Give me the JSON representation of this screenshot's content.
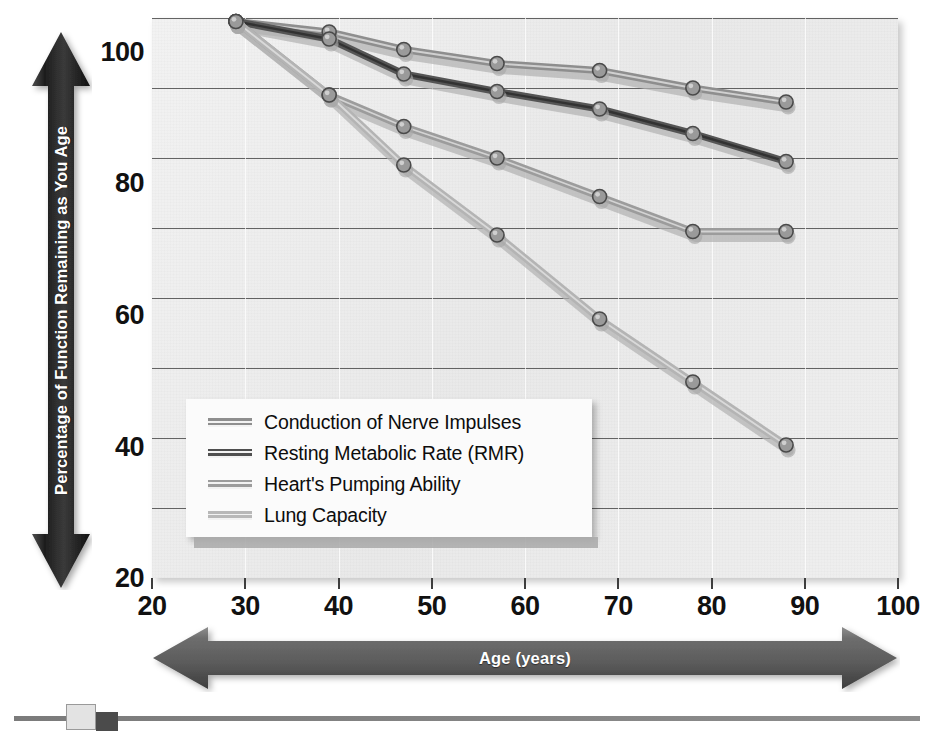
{
  "chart_data": {
    "type": "line",
    "title": "",
    "subtitle": "",
    "xlabel": "Age (years)",
    "ylabel": "Percentage of Function Remaining as You Age",
    "xlim": [
      20,
      100
    ],
    "ylim": [
      20,
      100
    ],
    "x_ticks": [
      20,
      30,
      40,
      50,
      60,
      70,
      80,
      90,
      100
    ],
    "y_ticks": [
      20,
      40,
      60,
      80,
      100
    ],
    "y_gridlines": [
      20,
      30,
      40,
      50,
      60,
      70,
      80,
      90,
      100
    ],
    "grid": true,
    "legend_position": "lower-left",
    "x": [
      29,
      39,
      47,
      57,
      68,
      78,
      88
    ],
    "series": [
      {
        "name": "Conduction of Nerve Impulses",
        "color": "#8e8e8e",
        "values": [
          99.5,
          98.0,
          95.5,
          93.5,
          92.5,
          90.0,
          88.0
        ]
      },
      {
        "name": "Resting Metabolic Rate (RMR)",
        "color": "#555555",
        "values": [
          99.5,
          97.0,
          92.0,
          89.5,
          87.0,
          83.5,
          79.5
        ]
      },
      {
        "name": "Heart's Pumping Ability",
        "color": "#9c9c9c",
        "values": [
          99.5,
          89.0,
          84.5,
          80.0,
          74.5,
          69.5,
          69.5
        ]
      },
      {
        "name": "Lung Capacity",
        "color": "#b4b4b4",
        "values": [
          99.5,
          89.0,
          79.0,
          69.0,
          57.0,
          48.0,
          39.0
        ]
      }
    ]
  },
  "axes": {
    "y": {
      "title": "Percentage of Function Remaining as You Age",
      "tick_labels": [
        "100",
        "80",
        "60",
        "40",
        "20"
      ],
      "arrow_color": "#2b2b2b"
    },
    "x": {
      "title": "Age (years)",
      "tick_labels": [
        "20",
        "30",
        "40",
        "50",
        "60",
        "70",
        "80",
        "90",
        "100"
      ],
      "arrow_color": "#636363"
    }
  },
  "legend": {
    "items": [
      {
        "label": "Conduction of Nerve Impulses",
        "swatch": "#8e8e8e"
      },
      {
        "label": "Resting Metabolic Rate (RMR)",
        "swatch": "#4f4f4f"
      },
      {
        "label": "Heart's Pumping Ability",
        "swatch": "#9c9c9c"
      },
      {
        "label": "Lung Capacity",
        "swatch": "#b8b8b8"
      }
    ]
  },
  "plot_style": {
    "background": "#eeeeee",
    "gridline_color": "#4a4a4a",
    "marker_fill": "#9a9a9a",
    "marker_edge": "#4a4a4a"
  },
  "bottom_control": {
    "track_color": "#828282",
    "handle_light_color": "#e3e3e3",
    "handle_dark_color": "#4b4b4b"
  }
}
